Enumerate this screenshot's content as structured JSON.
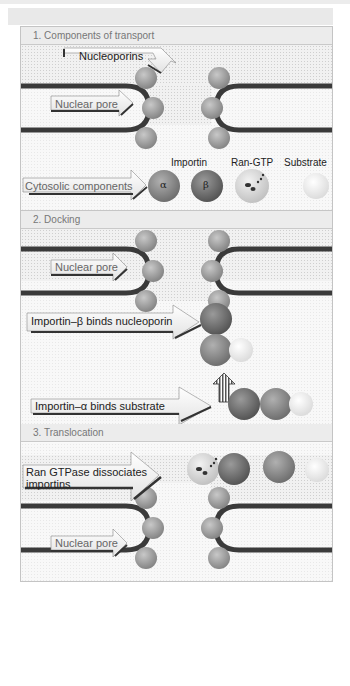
{
  "colors": {
    "membrane": "#3a3a3a",
    "nucleoporin": "#9a9a9a",
    "importin_alpha": "#8a8a8a",
    "importin_beta": "#6e6e6e",
    "ran_gtp": "#d4d4d4",
    "substrate": "#f0f0f0",
    "header_bg": "#ececec",
    "header_text": "#777777"
  },
  "panels": [
    {
      "title": "1. Components of transport",
      "labels": {
        "nucleoporins": "Nucleoporins",
        "nuclear_pore": "Nuclear pore",
        "cytosolic": "Cytosolic components"
      },
      "legend": {
        "importin": "Importin",
        "ran_gtp": "Ran-GTP",
        "substrate": "Substrate",
        "alpha": "α",
        "beta": "β"
      }
    },
    {
      "title": "2. Docking",
      "labels": {
        "nuclear_pore": "Nuclear pore",
        "importin_beta_binds": "Importin–β binds nucleoporin",
        "importin_alpha_binds": "Importin–α binds substrate"
      }
    },
    {
      "title": "3. Translocation",
      "labels": {
        "ran_dissociates_line1": "Ran GTPase dissociates",
        "ran_dissociates_line2": "importins",
        "nuclear_pore": "Nuclear pore"
      }
    }
  ]
}
